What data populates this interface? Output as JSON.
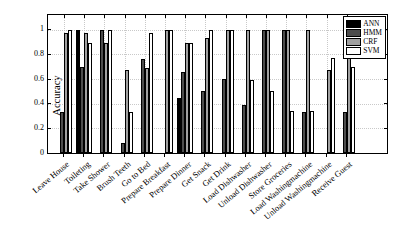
{
  "figure": {
    "ylabel": "Accuracy"
  },
  "chart_data": {
    "type": "bar",
    "title": "",
    "xlabel": "",
    "ylabel": "Accuracy",
    "ylim": [
      0,
      1.12
    ],
    "yticks": [
      0,
      0.2,
      0.4,
      0.6,
      0.8,
      1
    ],
    "ytick_labels": [
      "0",
      "0.2",
      "0.4",
      "0.6",
      "0.8",
      "1"
    ],
    "grid": true,
    "legend_position": "top-right",
    "categories": [
      "Leave House",
      "Toileting",
      "Take Shower",
      "Brush Teeth",
      "Go to Bed",
      "Prepare Breakfast",
      "Prepare Dinner",
      "Get Snack",
      "Get Drink",
      "Load Dishwasher",
      "Unload Dishwasher",
      "Store Groceries",
      "Load Washingmachine",
      "Unload Washingmachine",
      "Receive Guest"
    ],
    "series": [
      {
        "name": "ANN",
        "color": "#000000",
        "values": [
          0,
          1.0,
          0,
          0,
          0,
          0,
          0.45,
          0,
          0,
          0,
          0,
          0,
          0,
          0,
          0
        ]
      },
      {
        "name": "HMM",
        "color": "#4d4d4d",
        "values": [
          0.33,
          0.7,
          1.0,
          0.08,
          0.76,
          0,
          0.66,
          0.5,
          0.6,
          0.39,
          1.0,
          1.0,
          0.33,
          0,
          0.33
        ]
      },
      {
        "name": "CRF",
        "color": "#a0a0a0",
        "values": [
          0.97,
          0.97,
          0.89,
          0.67,
          0.69,
          1.0,
          0.89,
          0.93,
          1.0,
          1.0,
          1.0,
          1.0,
          1.0,
          0.67,
          1.0
        ]
      },
      {
        "name": "SVM",
        "color": "#ffffff",
        "values": [
          1.0,
          0.89,
          1.0,
          0.33,
          0.97,
          1.0,
          0.89,
          1.0,
          1.0,
          0.59,
          0.5,
          0.34,
          0.34,
          0.77,
          0.7
        ]
      }
    ]
  }
}
